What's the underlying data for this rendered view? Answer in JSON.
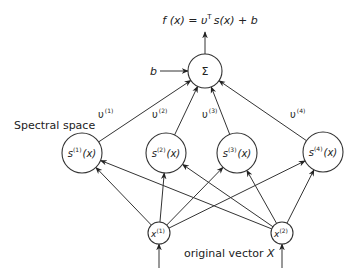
{
  "output_formula": {
    "prefix": "f (x) = υ",
    "sup": "T",
    "s_vec": "s",
    "suffix": "(x) + b"
  },
  "bias_label": "b",
  "sum_symbol": "Σ",
  "spectral_space_label": "Spectral space",
  "input_label": {
    "text": "original vector ",
    "var": "X"
  },
  "weights": [
    {
      "base": "υ",
      "sup": "(1)"
    },
    {
      "base": "υ",
      "sup": "(2)"
    },
    {
      "base": "υ",
      "sup": "(3)"
    },
    {
      "base": "υ",
      "sup": "(4)"
    }
  ],
  "spectral_nodes": [
    {
      "base": "s",
      "sup": "(1)",
      "arg": "(x)"
    },
    {
      "base": "s",
      "sup": "(2)",
      "arg": "(x)"
    },
    {
      "base": "s",
      "sup": "(3)",
      "arg": "(x)"
    },
    {
      "base": "s",
      "sup": "(4)",
      "arg": "(x)"
    }
  ],
  "input_nodes": [
    {
      "base": "x",
      "sup": "(1)"
    },
    {
      "base": "x",
      "sup": "(2)"
    }
  ]
}
